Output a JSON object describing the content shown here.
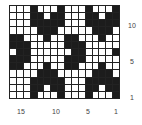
{
  "chart": {
    "title": "",
    "columns": 16,
    "rows": 13,
    "colors": {
      "filled": "#1c1c1c",
      "empty": "#ffffff",
      "grid": "#222222"
    },
    "grid_rows_top_to_bottom": [
      "0001000100010001",
      "0001101100011011",
      "0001111100011111",
      "0000111000001110",
      "1100010011000100",
      "1110000011100000",
      "0110000001100001",
      "1110000011100000",
      "1100010011000100",
      "0000111000001110",
      "0001111100011111",
      "0001101100011011",
      "0001000100010001"
    ],
    "column_labels": [
      {
        "text": "15",
        "x": 17
      },
      {
        "text": "10",
        "x": 52
      },
      {
        "text": "5",
        "x": 86
      },
      {
        "text": "1",
        "x": 114
      }
    ],
    "row_labels": [
      {
        "text": "10",
        "y": 22
      },
      {
        "text": "5",
        "y": 58
      },
      {
        "text": "1",
        "y": 94
      }
    ]
  }
}
